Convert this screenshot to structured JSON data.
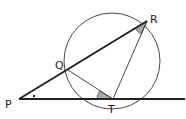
{
  "diagram": {
    "type": "circle-tangent-secant",
    "labels": {
      "P": "P",
      "Q": "Q",
      "R": "R",
      "T": "T"
    },
    "points": {
      "P": [
        19,
        99
      ],
      "Q": [
        68,
        70
      ],
      "R": [
        147,
        21
      ],
      "T": [
        113,
        99
      ]
    },
    "circle": {
      "cx": 112,
      "cy": 61,
      "r": 48
    },
    "angle_marks": [
      {
        "at": "P",
        "style": "dot"
      },
      {
        "at": "T",
        "between": [
          "Q",
          "P"
        ],
        "style": "shaded"
      },
      {
        "at": "R",
        "between": [
          "P",
          "T"
        ],
        "style": "shaded"
      }
    ],
    "colors": {
      "line": "#222222",
      "shade": "#a9a9a9"
    }
  }
}
